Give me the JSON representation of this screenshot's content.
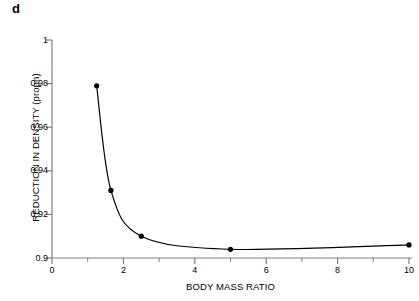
{
  "panel": {
    "label": "d"
  },
  "chart_data": {
    "type": "line",
    "title": "",
    "subtitle": "",
    "panel_label": "d",
    "xlabel": "BODY MASS RATIO",
    "ylabel": "REDUCTION IN DENSITY (propn)",
    "xlim": [
      0,
      10
    ],
    "ylim": [
      0.9,
      1
    ],
    "xticks": [
      0,
      2,
      4,
      6,
      8,
      10
    ],
    "xtick_labels": [
      "0",
      "2",
      "4",
      "6",
      "8",
      "10"
    ],
    "xminorticks": [
      1,
      3,
      5,
      7,
      9
    ],
    "yticks": [
      0.9,
      0.92,
      0.94,
      0.96,
      0.98,
      1
    ],
    "ytick_labels": [
      "0.9",
      "0.92",
      "0.94",
      "0.96",
      "0.98",
      "1"
    ],
    "grid": false,
    "legend": false,
    "legend_position": "none",
    "marker": "filled-circle",
    "line_color": "#000000",
    "marker_color": "#000000",
    "axis_color": "#808080",
    "background": "#ffffff",
    "x": [
      1.25,
      1.65,
      2.5,
      5,
      10
    ],
    "y": [
      0.979,
      0.931,
      0.91,
      0.904,
      0.906
    ],
    "series": [
      {
        "name": "reduction in density",
        "points": [
          {
            "x": 1.25,
            "y": 0.979
          },
          {
            "x": 1.65,
            "y": 0.931
          },
          {
            "x": 2.5,
            "y": 0.91
          },
          {
            "x": 5,
            "y": 0.904
          },
          {
            "x": 10,
            "y": 0.906
          }
        ]
      }
    ]
  }
}
